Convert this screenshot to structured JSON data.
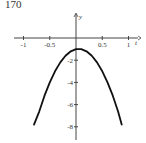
{
  "problem_number": "170",
  "chart_data": {
    "type": "line",
    "title": "",
    "xlabel": "t",
    "ylabel": "y",
    "xlim": [
      -1.1,
      1.15
    ],
    "ylim": [
      -9,
      1.5
    ],
    "grid": false,
    "x_ticks": [
      -1,
      -0.5,
      0.5,
      1
    ],
    "x_tick_labels": [
      "-1",
      "-0.5",
      "0.5",
      "1"
    ],
    "y_ticks": [
      -2,
      -4,
      -6,
      -8
    ],
    "y_tick_labels": [
      "-2",
      "-4",
      "-6",
      "-8"
    ],
    "series": [
      {
        "name": "y(t)",
        "x": [
          -0.8,
          -0.7,
          -0.6,
          -0.5,
          -0.4,
          -0.3,
          -0.2,
          -0.1,
          0,
          0.05,
          0.1,
          0.2,
          0.3,
          0.4,
          0.5,
          0.6,
          0.7,
          0.8,
          0.87
        ],
        "y": [
          -7.8,
          -6.6,
          -5.2,
          -4.0,
          -3.0,
          -2.2,
          -1.6,
          -1.2,
          -1.0,
          -1.0,
          -1.0,
          -1.2,
          -1.6,
          -2.2,
          -3.0,
          -4.0,
          -5.2,
          -6.6,
          -7.8
        ]
      }
    ]
  }
}
